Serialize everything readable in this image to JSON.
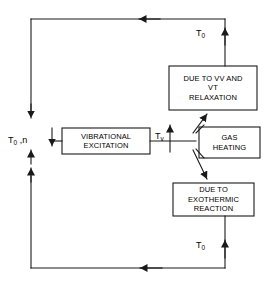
{
  "diagram": {
    "stroke_color": "#1a1a1a",
    "background_color": "#ffffff",
    "boxes": [
      {
        "id": "vibrational_excitation",
        "label": "VIBRATIONAL\nEXCITATION"
      },
      {
        "id": "vv_vt_relaxation",
        "label": "DUE TO VV AND\nVT\nRELAXATION"
      },
      {
        "id": "gas_heating",
        "label": "GAS\nHEATING"
      },
      {
        "id": "exothermic_reaction",
        "label": "DUE TO\nEXOTHERMIC\nREACTION"
      }
    ],
    "labels": {
      "inlet": {
        "symbol": "T",
        "subscript": "0",
        "suffix": " ,n"
      },
      "vibrational_temperature": {
        "symbol": "T",
        "subscript": "v"
      },
      "outlet_top": {
        "symbol": "T",
        "subscript": "0"
      },
      "outlet_bottom": {
        "symbol": "T",
        "subscript": "0"
      }
    }
  }
}
